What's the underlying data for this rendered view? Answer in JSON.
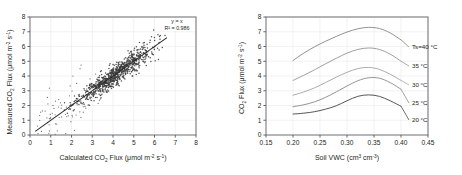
{
  "figure": {
    "panels": [
      "scatter-validation",
      "moisture-response"
    ]
  },
  "left_panel": {
    "annotation_line1": "y = x",
    "annotation_line2": "R² = 0.986",
    "xlabel_main": "Calculated CO",
    "xlabel_sub": "2",
    "xlabel_rest": " Flux (μmol m",
    "xlabel_exp1": "-2",
    "xlabel_mid": " s",
    "xlabel_exp2": "-1",
    "xlabel_close": ")",
    "ylabel_main": "Measured CO",
    "ylabel_sub": "2",
    "ylabel_rest": " Flux (μmol m",
    "ylabel_exp1": "-2",
    "ylabel_mid": " s",
    "ylabel_exp2": "-1",
    "ylabel_close": ")",
    "xticks": [
      "0",
      "1",
      "2",
      "3",
      "4",
      "5",
      "6",
      "7",
      "8"
    ],
    "yticks": [
      "0",
      "1",
      "2",
      "3",
      "4",
      "5",
      "6",
      "7",
      "8"
    ]
  },
  "right_panel": {
    "xlabel_main": "Soil VWC (cm",
    "xlabel_exp1": "3",
    "xlabel_mid": " cm",
    "xlabel_exp2": "-3",
    "xlabel_close": ")",
    "ylabel_main": "CO",
    "ylabel_sub": "2",
    "ylabel_rest": " Flux (μmol m",
    "ylabel_exp1": "-2",
    "ylabel_mid": " s",
    "ylabel_exp2": "-1",
    "ylabel_close": ")",
    "xticks": [
      "0.15",
      "0.20",
      "0.25",
      "0.30",
      "0.35",
      "0.40",
      "0.45"
    ],
    "yticks": [
      "0",
      "1",
      "2",
      "3",
      "4",
      "5",
      "6",
      "7",
      "8"
    ],
    "curve_labels": [
      "Ts=40 °C",
      "35 °C",
      "30 °C",
      "25 °C",
      "20 °C"
    ]
  },
  "chart_data": [
    {
      "type": "scatter",
      "panel": "left",
      "title": "",
      "xlabel": "Calculated CO2 Flux (μmol m-2 s-1)",
      "ylabel": "Measured CO2 Flux (μmol m-2 s-1)",
      "xlim": [
        0,
        8
      ],
      "ylim": [
        0,
        8
      ],
      "xticks": [
        0,
        1,
        2,
        3,
        4,
        5,
        6,
        7,
        8
      ],
      "yticks": [
        0,
        1,
        2,
        3,
        4,
        5,
        6,
        7,
        8
      ],
      "grid": true,
      "legend": "none",
      "annotations": [
        "y = x",
        "R² = 0.986"
      ],
      "fit_line": {
        "slope": 1,
        "intercept": 0,
        "x_start": 0.25,
        "x_end": 6.6
      },
      "point_color": "#3a3a3a",
      "n_points_drawn": 900,
      "cloud_description": "Dense 1:1 cloud from ~0.3 to ~6.6 with increasing density near 4-5; sparse scattered outliers below 3.",
      "cloud_spec": {
        "x_min": 0.3,
        "x_max": 6.6,
        "core_x_mean": 4.1,
        "core_x_sd": 0.85,
        "residual_sd": 0.33,
        "outlier_fraction": 0.08,
        "outlier_residual_sd": 0.85
      }
    },
    {
      "type": "line",
      "panel": "right",
      "title": "",
      "xlabel": "Soil VWC (cm3 cm-3)",
      "ylabel": "CO2 Flux (μmol m-2 s-1)",
      "xlim": [
        0.15,
        0.45
      ],
      "ylim": [
        0,
        8
      ],
      "xticks": [
        0.15,
        0.2,
        0.25,
        0.3,
        0.35,
        0.4,
        0.45
      ],
      "yticks": [
        0,
        1,
        2,
        3,
        4,
        5,
        6,
        7,
        8
      ],
      "grid": true,
      "legend": "inline-right",
      "x": [
        0.2,
        0.22,
        0.24,
        0.26,
        0.28,
        0.3,
        0.32,
        0.34,
        0.36,
        0.38,
        0.4
      ],
      "series": [
        {
          "name": "Ts=40 °C",
          "color": "#8c8c8c",
          "values": [
            5.05,
            5.55,
            5.98,
            6.35,
            6.68,
            6.98,
            7.2,
            7.3,
            7.22,
            6.92,
            6.45
          ]
        },
        {
          "name": "35 °C",
          "color": "#9a9a9a",
          "values": [
            3.7,
            4.05,
            4.42,
            4.82,
            5.2,
            5.55,
            5.8,
            5.9,
            5.8,
            5.48,
            5.0
          ]
        },
        {
          "name": "30 °C",
          "color": "#a8a8a8",
          "values": [
            2.7,
            2.92,
            3.2,
            3.55,
            3.92,
            4.25,
            4.5,
            4.58,
            4.45,
            4.12,
            3.7
          ]
        },
        {
          "name": "25 °C",
          "color": "#8f8f8f",
          "values": [
            1.92,
            2.05,
            2.25,
            2.55,
            2.92,
            3.32,
            3.68,
            3.88,
            3.85,
            3.55,
            3.1
          ]
        },
        {
          "name": "20 °C",
          "color": "#4d4d4d",
          "values": [
            1.42,
            1.48,
            1.58,
            1.75,
            1.98,
            2.32,
            2.62,
            2.72,
            2.62,
            2.32,
            1.95
          ]
        }
      ]
    }
  ]
}
